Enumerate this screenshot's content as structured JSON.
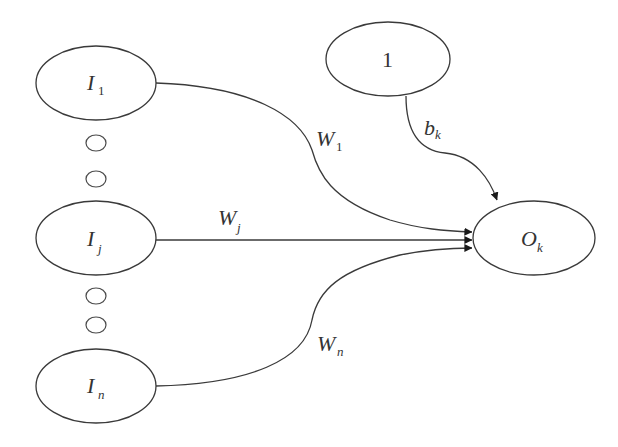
{
  "diagram": {
    "type": "neural-network-neuron",
    "colors": {
      "stroke": "#3a3a3a",
      "text": "#333333",
      "background": "#ffffff"
    },
    "nodes": {
      "input_1": {
        "main": "I",
        "sub": "1"
      },
      "input_j": {
        "main": "I",
        "sub": "j"
      },
      "input_n": {
        "main": "I",
        "sub": "n"
      },
      "bias": {
        "label": "1"
      },
      "output": {
        "main": "O",
        "sub": "k"
      }
    },
    "ellipsis_dots": 4,
    "edges": {
      "w1": {
        "main": "W",
        "sub": "1",
        "from": "input_1",
        "to": "output"
      },
      "wj": {
        "main": "W",
        "sub": "j",
        "from": "input_j",
        "to": "output"
      },
      "wn": {
        "main": "W",
        "sub": "n",
        "from": "input_n",
        "to": "output"
      },
      "bk": {
        "main": "b",
        "sub": "k",
        "from": "bias",
        "to": "output"
      }
    }
  }
}
